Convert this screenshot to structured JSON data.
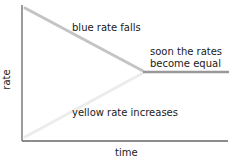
{
  "diagram": {
    "axes": {
      "x_label": "time",
      "y_label": "rate",
      "color": "#666666"
    },
    "lines": {
      "blue_rate": {
        "color": "#c4c4c4",
        "description": "falling line"
      },
      "yellow_rate": {
        "color": "#ececec",
        "description": "rising line"
      },
      "equilibrium": {
        "color": "#999999"
      }
    },
    "annotations": {
      "blue": "blue rate falls",
      "equal_line1": "soon the rates",
      "equal_line2": "become equal",
      "yellow": "yellow rate increases"
    }
  }
}
